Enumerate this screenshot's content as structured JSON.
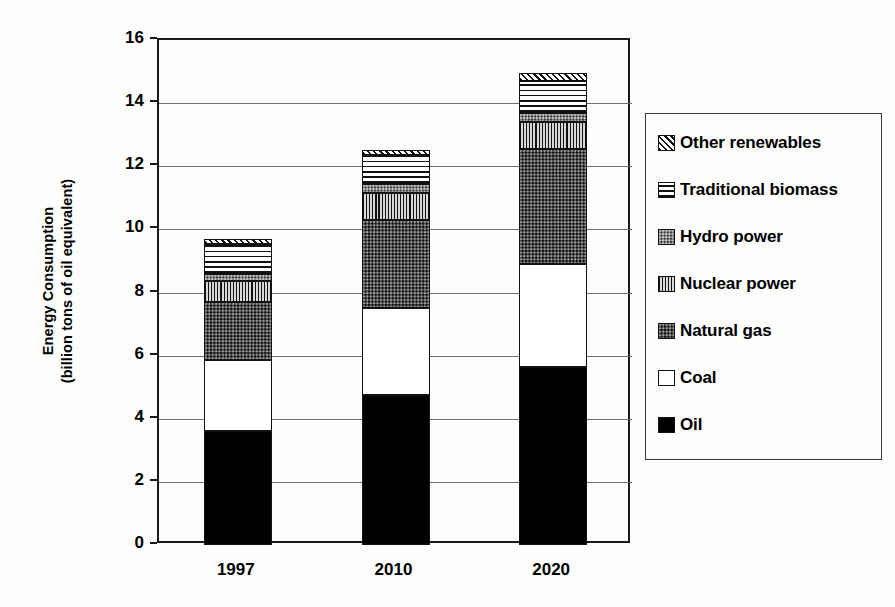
{
  "chart_data": {
    "type": "bar",
    "subtype": "stacked-bar",
    "title": "",
    "xlabel": "",
    "ylabel": "Energy Consumption (billion tons of oil equivalent)",
    "ylabel_line1": "Energy Consumption",
    "ylabel_line2": "(billion tons of oil equivalent)",
    "categories": [
      "1997",
      "2010",
      "2020"
    ],
    "ylim": [
      0,
      16
    ],
    "yticks": [
      16,
      14,
      12,
      10,
      8,
      6,
      4,
      2,
      0
    ],
    "grid": true,
    "grid_axis": "y",
    "legend_position": "right",
    "stack_order_bottom_to_top": [
      "Oil",
      "Coal",
      "Natural gas",
      "Nuclear power",
      "Hydro power",
      "Traditional biomass",
      "Other renewables"
    ],
    "series": [
      {
        "name": "Oil",
        "pattern": "solid-black",
        "values": [
          3.6,
          4.75,
          5.65
        ]
      },
      {
        "name": "Coal",
        "pattern": "white",
        "values": [
          2.25,
          2.75,
          3.25
        ]
      },
      {
        "name": "Natural gas",
        "pattern": "dark-stipple",
        "values": [
          1.85,
          2.8,
          3.65
        ]
      },
      {
        "name": "Nuclear power",
        "pattern": "vertical-lines",
        "values": [
          0.65,
          0.85,
          0.85
        ]
      },
      {
        "name": "Hydro power",
        "pattern": "mid-stipple",
        "values": [
          0.25,
          0.3,
          0.3
        ]
      },
      {
        "name": "Traditional biomass",
        "pattern": "horizontal-lines",
        "values": [
          0.95,
          0.9,
          1.0
        ]
      },
      {
        "name": "Other renewables",
        "pattern": "diagonal-hatch",
        "values": [
          0.15,
          0.15,
          0.25
        ]
      }
    ],
    "totals": [
      9.7,
      12.5,
      14.95
    ]
  },
  "legend": {
    "items": [
      {
        "label": "Other renewables",
        "pattern": "diagonal-hatch"
      },
      {
        "label": "Traditional biomass",
        "pattern": "horizontal-lines"
      },
      {
        "label": "Hydro power",
        "pattern": "mid-stipple"
      },
      {
        "label": "Nuclear power",
        "pattern": "vertical-lines"
      },
      {
        "label": "Natural gas",
        "pattern": "dark-stipple"
      },
      {
        "label": "Coal",
        "pattern": "white"
      },
      {
        "label": "Oil",
        "pattern": "solid-black"
      }
    ]
  },
  "colors": {
    "axis": "#1a1a1a",
    "grid": "#6e6e6e",
    "background": "#fdfdfc",
    "text": "#000000"
  }
}
